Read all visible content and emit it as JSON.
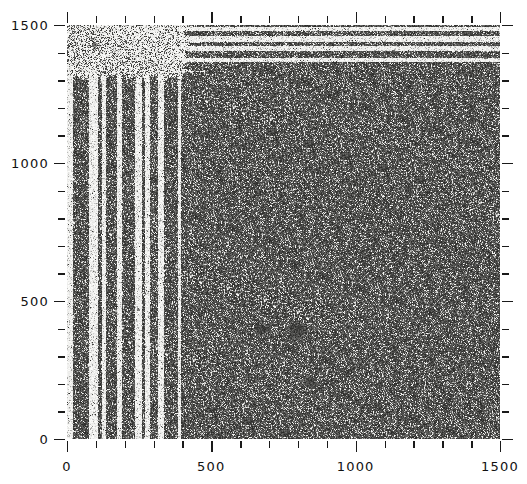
{
  "figure": {
    "kind": "astronomical-image-plate",
    "title_fragment": "",
    "background_color": "#ffffff",
    "ink_color": "#1a1a1a"
  },
  "plate": {
    "name": "sky-image",
    "description": "Grainy photographic sky plate with point sources and extended objects",
    "left_px": 67,
    "top_px": 25,
    "width_px": 433,
    "height_px": 414,
    "base_gray": "#f2f1ef",
    "grain_color": "#3a3a3a"
  },
  "chart_data": {
    "type": "scatter",
    "title": "",
    "xlabel": "",
    "ylabel": "",
    "xlim": [
      0,
      1500
    ],
    "ylim": [
      0,
      1500
    ],
    "grid": false,
    "legend": "none",
    "xticks_major": [
      0,
      500,
      1000,
      1500
    ],
    "xticklabels": [
      "0",
      "500",
      "1000",
      "1500"
    ],
    "yticks_major": [
      0,
      500,
      1000,
      1500
    ],
    "yticklabels": [
      "0",
      "500",
      "1000",
      "1500"
    ],
    "xticks_minor": [
      100,
      200,
      300,
      400,
      600,
      700,
      800,
      900,
      1100,
      1200,
      1300,
      1400
    ],
    "yticks_minor": [
      100,
      200,
      300,
      400,
      600,
      700,
      800,
      900,
      1100,
      1200,
      1300,
      1400
    ],
    "tick_direction": "out-and-in",
    "axes_frame": "ticks-only",
    "units": "pixels",
    "sources": [
      {
        "x": 795,
        "y": 395,
        "r": 30,
        "amp": 0.62,
        "label": "bright-object-A"
      },
      {
        "x": 672,
        "y": 398,
        "r": 24,
        "amp": 0.52,
        "label": "bright-object-B"
      },
      {
        "x": 840,
        "y": 210,
        "r": 22,
        "amp": 0.5,
        "label": "bright-object-C"
      },
      {
        "x": 560,
        "y": 670,
        "r": 14,
        "amp": 0.42
      },
      {
        "x": 470,
        "y": 840,
        "r": 13,
        "amp": 0.4
      },
      {
        "x": 1020,
        "y": 680,
        "r": 14,
        "amp": 0.4
      },
      {
        "x": 1185,
        "y": 905,
        "r": 12,
        "amp": 0.38
      },
      {
        "x": 1450,
        "y": 1390,
        "r": 12,
        "amp": 0.4
      },
      {
        "x": 1130,
        "y": 1400,
        "r": 11,
        "amp": 0.38
      },
      {
        "x": 60,
        "y": 880,
        "r": 12,
        "amp": 0.4
      },
      {
        "x": 95,
        "y": 1430,
        "r": 11,
        "amp": 0.36
      },
      {
        "x": 355,
        "y": 620,
        "r": 10,
        "amp": 0.34
      },
      {
        "x": 705,
        "y": 1250,
        "r": 9,
        "amp": 0.3
      },
      {
        "x": 905,
        "y": 1255,
        "r": 9,
        "amp": 0.3
      },
      {
        "x": 1185,
        "y": 260,
        "r": 10,
        "amp": 0.33
      },
      {
        "x": 440,
        "y": 250,
        "r": 10,
        "amp": 0.33
      },
      {
        "x": 640,
        "y": 120,
        "r": 9,
        "amp": 0.3
      },
      {
        "x": 245,
        "y": 470,
        "r": 8,
        "amp": 0.28
      },
      {
        "x": 1320,
        "y": 1150,
        "r": 8,
        "amp": 0.26
      },
      {
        "x": 1075,
        "y": 905,
        "r": 13,
        "amp": 0.3,
        "label": "faint-extended"
      }
    ],
    "brightness_gradient": {
      "note": "plate background density falls off toward upper-right",
      "dense_corner": "lower-left",
      "sparse_corner": "upper-right"
    }
  }
}
